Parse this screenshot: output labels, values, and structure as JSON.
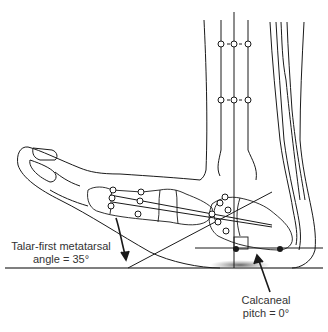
{
  "diagram": {
    "annotations": [
      {
        "id": "talar",
        "line1": "Talar-first metatarsal",
        "line2": "angle = 35°"
      },
      {
        "id": "calcaneal",
        "line1": "Calcaneal",
        "line2": "pitch = 0°"
      }
    ],
    "colors": {
      "line": "#1a1a1a",
      "text": "#333333",
      "shadow": "#777777",
      "ground": "#555555"
    }
  }
}
